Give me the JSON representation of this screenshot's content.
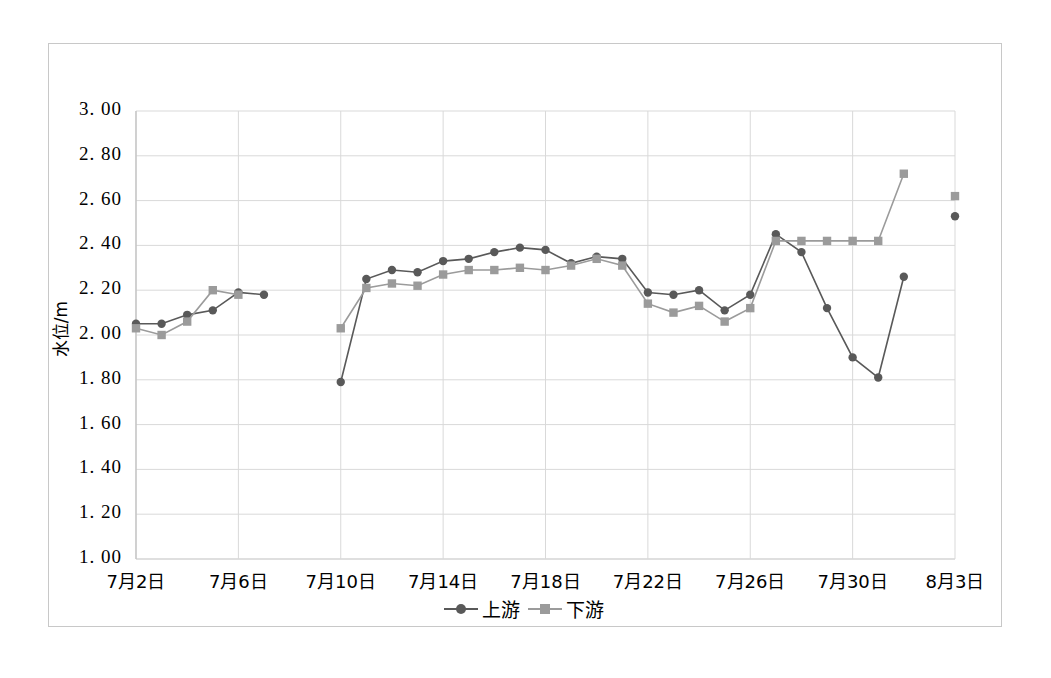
{
  "chart_data": {
    "type": "line",
    "title": "",
    "xlabel": "",
    "ylabel": "水位/m",
    "ylim": [
      1.0,
      3.0
    ],
    "ytick_labels": [
      "3. 00",
      "2. 80",
      "2. 60",
      "2. 40",
      "2. 20",
      "2. 00",
      "1. 80",
      "1. 60",
      "1. 40",
      "1. 20",
      "1. 00"
    ],
    "ytick_values": [
      3.0,
      2.8,
      2.6,
      2.4,
      2.2,
      2.0,
      1.8,
      1.6,
      1.4,
      1.2,
      1.0
    ],
    "xtick_labels": [
      "7月2日",
      "7月6日",
      "7月10日",
      "7月14日",
      "7月18日",
      "7月22日",
      "7月26日",
      "7月30日",
      "8月3日"
    ],
    "xtick_index": [
      0,
      4,
      8,
      12,
      16,
      20,
      24,
      28,
      32
    ],
    "x": [
      "7月2日",
      "7月3日",
      "7月4日",
      "7月5日",
      "7月6日",
      "7月7日",
      "7月8日",
      "7月9日",
      "7月10日",
      "7月11日",
      "7月12日",
      "7月13日",
      "7月14日",
      "7月15日",
      "7月16日",
      "7月17日",
      "7月18日",
      "7月19日",
      "7月20日",
      "7月21日",
      "7月22日",
      "7月23日",
      "7月24日",
      "7月25日",
      "7月26日",
      "7月27日",
      "7月28日",
      "7月29日",
      "7月30日",
      "7月31日",
      "8月1日",
      "8月2日",
      "8月3日"
    ],
    "grid": true,
    "legend_position": "bottom-center",
    "series": [
      {
        "name": "上游",
        "color": "#595959",
        "marker": "circle",
        "values": [
          2.05,
          2.05,
          2.09,
          2.11,
          2.19,
          2.18,
          null,
          null,
          1.79,
          2.25,
          2.29,
          2.28,
          2.33,
          2.34,
          2.37,
          2.39,
          2.38,
          2.32,
          2.35,
          2.34,
          2.19,
          2.18,
          2.2,
          2.11,
          2.18,
          2.45,
          2.37,
          2.12,
          1.9,
          1.81,
          2.26,
          null,
          2.53
        ]
      },
      {
        "name": "下游",
        "color": "#9b9b9b",
        "marker": "square",
        "values": [
          2.03,
          2.0,
          2.06,
          2.2,
          2.18,
          null,
          null,
          null,
          2.03,
          2.21,
          2.23,
          2.22,
          2.27,
          2.29,
          2.29,
          2.3,
          2.29,
          2.31,
          2.34,
          2.31,
          2.14,
          2.1,
          2.13,
          2.06,
          2.12,
          2.42,
          2.42,
          2.42,
          2.42,
          2.42,
          2.72,
          null,
          2.62
        ]
      }
    ]
  },
  "legend": {
    "items": [
      {
        "label": "上游",
        "color": "#595959",
        "marker": "circle"
      },
      {
        "label": "下游",
        "color": "#9b9b9b",
        "marker": "square"
      }
    ]
  },
  "colors": {
    "upstream": "#595959",
    "downstream": "#9b9b9b",
    "grid": "#d9d9d9",
    "axis": "#bfbfbf",
    "border": "#c8c8c8",
    "text": "#000000"
  }
}
